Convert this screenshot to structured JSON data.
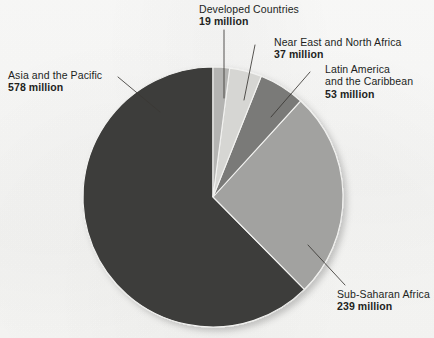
{
  "figure": {
    "background_color": "#fbfbfa",
    "text_color": "#221f1d"
  },
  "chart_data": {
    "type": "pie",
    "title": "",
    "subtitle": "",
    "xlabel": "",
    "ylabel": "",
    "unit": "million",
    "total": 926,
    "legend_position": "callout-labels",
    "grid": false,
    "start_angle_deg": 0,
    "direction": "clockwise",
    "categories": [
      "Developed Countries",
      "Near East and North Africa",
      "Latin America and the Caribbean",
      "Sub-Saharan Africa",
      "Asia and the Pacific"
    ],
    "values": [
      19,
      37,
      53,
      239,
      578
    ],
    "value_labels": [
      "19 million",
      "37 million",
      "53 million",
      "239 million",
      "578 million"
    ],
    "colors": [
      "#b4b4b2",
      "#d6d6d3",
      "#7a7a78",
      "#a2a2a0",
      "#3d3d3b"
    ],
    "slices": [
      {
        "name": "Developed Countries",
        "value": 19,
        "value_label": "19 million",
        "color": "#b4b4b2",
        "start_deg": 0.0,
        "sweep_deg": 7.39
      },
      {
        "name": "Near East and North Africa",
        "value": 37,
        "value_label": "37 million",
        "color": "#d6d6d3",
        "start_deg": 7.39,
        "sweep_deg": 14.39
      },
      {
        "name": "Latin America and the Caribbean",
        "value": 53,
        "value_label": "53 million",
        "color": "#7a7a78",
        "start_deg": 21.78,
        "sweep_deg": 20.61
      },
      {
        "name": "Sub-Saharan Africa",
        "value": 239,
        "value_label": "239 million",
        "color": "#a2a2a0",
        "start_deg": 42.39,
        "sweep_deg": 92.92
      },
      {
        "name": "Asia and the Pacific",
        "value": 578,
        "value_label": "578 million",
        "color": "#3d3d3b",
        "start_deg": 135.31,
        "sweep_deg": 224.69
      }
    ]
  },
  "labels": {
    "developed_countries": {
      "name": "Developed Countries",
      "value": "19 million"
    },
    "near_east": {
      "name": "Near East and North Africa",
      "value": "37 million"
    },
    "latin_america": {
      "name_line1": "Latin America",
      "name_line2": "and the Caribbean",
      "value": "53 million"
    },
    "asia_pacific": {
      "name": "Asia and the Pacific",
      "value": "578 million"
    },
    "sub_saharan_africa": {
      "name": "Sub-Saharan Africa",
      "value": "239 million"
    }
  }
}
